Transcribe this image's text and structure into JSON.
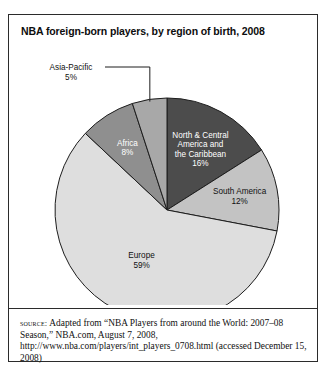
{
  "figure": {
    "title": "NBA foreign-born players, by region of birth, 2008",
    "source_label": "source:",
    "source_text": " Adapted from “NBA Players from around the World: 2007–08 Season,” NBA.com, August 7, 2008, http://www.nba.com/players/int_players_0708.html (accessed December 15, 2008)"
  },
  "chart_data": {
    "type": "pie",
    "title": "NBA foreign-born players, by region of birth, 2008",
    "unit": "percent",
    "start_angle_deg": 0,
    "direction": "clockwise",
    "total": 100,
    "categories": [
      "North & Central America and the Caribbean",
      "South America",
      "Europe",
      "Africa",
      "Asia-Pacific"
    ],
    "values": [
      16,
      12,
      59,
      8,
      5
    ],
    "slices": [
      {
        "name": "North & Central America and the Caribbean",
        "label_lines": [
          "North & Central",
          "America and",
          "the Caribbean",
          "16%"
        ],
        "value": 16,
        "color": "#4c4c4c",
        "label_color": "#ffffff",
        "label_placement": "inside"
      },
      {
        "name": "South America",
        "label_lines": [
          "South America",
          "12%"
        ],
        "value": 12,
        "color": "#c3c3c3",
        "label_color": "#111111",
        "label_placement": "inside"
      },
      {
        "name": "Europe",
        "label_lines": [
          "Europe",
          "59%"
        ],
        "value": 59,
        "color": "#dedede",
        "label_color": "#111111",
        "label_placement": "inside"
      },
      {
        "name": "Africa",
        "label_lines": [
          "Africa",
          "8%"
        ],
        "value": 8,
        "color": "#8f8f8f",
        "label_color": "#ffffff",
        "label_placement": "inside"
      },
      {
        "name": "Asia-Pacific",
        "label_lines": [
          "Asia-Pacific",
          "5%"
        ],
        "value": 5,
        "color": "#a8a8a8",
        "label_color": "#111111",
        "label_placement": "callout"
      }
    ],
    "legend": "none",
    "grid": false
  },
  "geometry": {
    "cx": 158,
    "cy": 165,
    "r": 112,
    "stroke": "#1d1d1d",
    "stroke_width": 1
  }
}
